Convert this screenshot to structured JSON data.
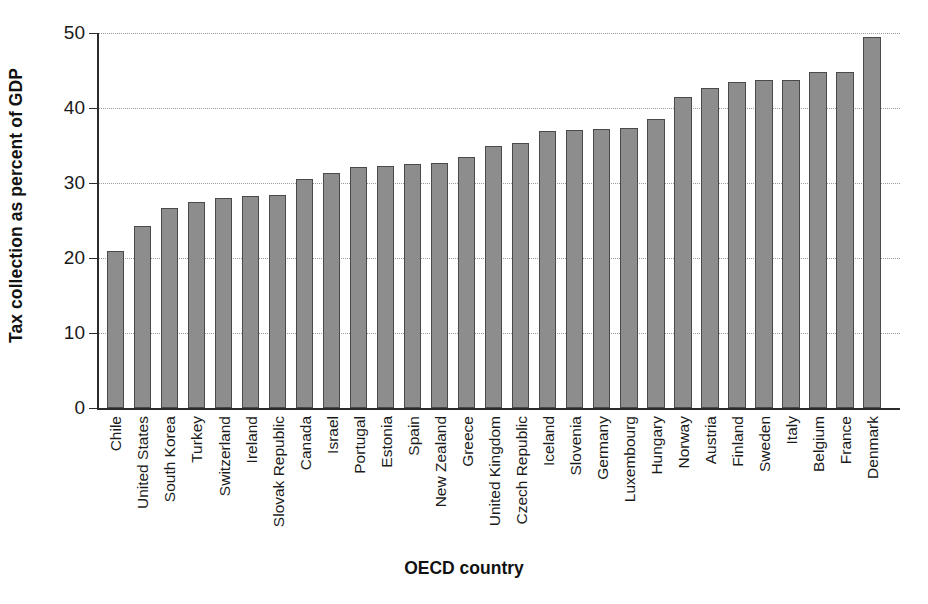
{
  "chart_data": {
    "type": "bar",
    "title": "",
    "xlabel": "OECD country",
    "ylabel": "Tax collection as percent of GDP",
    "ylim": [
      0,
      50
    ],
    "yticks": [
      0,
      10,
      20,
      30,
      40,
      50
    ],
    "ytick_labels": [
      "0",
      "10",
      "20",
      "30",
      "40",
      "50"
    ],
    "grid": "horizontal-dotted",
    "legend": "none",
    "bar_color": "#8d8d8d",
    "bar_edge_color": "#4a4a4a",
    "categories": [
      "Chile",
      "United States",
      "South Korea",
      "Turkey",
      "Switzerland",
      "Ireland",
      "Slovak Republic",
      "Canada",
      "Israel",
      "Portugal",
      "Estonia",
      "Spain",
      "New Zealand",
      "Greece",
      "United Kingdom",
      "Czech Republic",
      "Iceland",
      "Slovenia",
      "Germany",
      "Luxembourg",
      "Hungary",
      "Norway",
      "Austria",
      "Finland",
      "Sweden",
      "Italy",
      "Belgium",
      "France",
      "Denmark"
    ],
    "values": [
      20.9,
      24.3,
      26.7,
      27.5,
      28.0,
      28.3,
      28.4,
      30.6,
      31.3,
      32.2,
      32.3,
      32.5,
      32.7,
      33.5,
      35.0,
      35.3,
      37.0,
      37.1,
      37.2,
      37.4,
      38.6,
      41.5,
      42.7,
      43.5,
      43.8,
      43.8,
      44.8,
      44.8,
      49.5
    ]
  },
  "axis": {
    "y_title": "Tax collection as percent of GDP",
    "x_title": "OECD country"
  }
}
